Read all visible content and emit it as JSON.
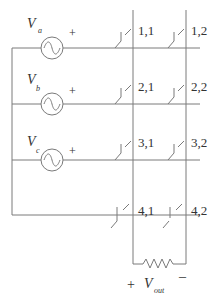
{
  "diagram": {
    "type": "crossbar-switch-circuit",
    "sources": [
      {
        "label": "V",
        "subscript": "a",
        "polarity": "+"
      },
      {
        "label": "V",
        "subscript": "b",
        "polarity": "+"
      },
      {
        "label": "V",
        "subscript": "c",
        "polarity": "+"
      }
    ],
    "switches": [
      {
        "id": "1,1"
      },
      {
        "id": "1,2"
      },
      {
        "id": "2,1"
      },
      {
        "id": "2,2"
      },
      {
        "id": "3,1"
      },
      {
        "id": "3,2"
      },
      {
        "id": "4,1"
      },
      {
        "id": "4,2"
      }
    ],
    "output": {
      "label": "V",
      "subscript": "out",
      "plus": "+",
      "minus": "–",
      "load": "resistor"
    }
  }
}
